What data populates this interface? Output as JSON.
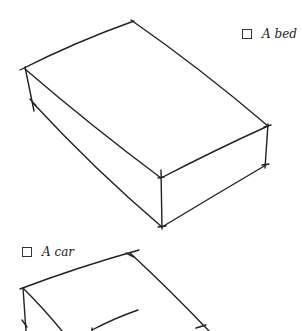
{
  "options": [
    {
      "label": "A bed",
      "checked": false
    },
    {
      "label": "A car",
      "checked": false
    }
  ],
  "drawings": [
    {
      "name": "bed-sketch",
      "description": "hand-drawn rectangular box (bed)"
    },
    {
      "name": "car-sketch",
      "description": "hand-drawn box with line (car), partially visible"
    }
  ],
  "colors": {
    "ink": "#222222",
    "background": "#ffffff"
  }
}
